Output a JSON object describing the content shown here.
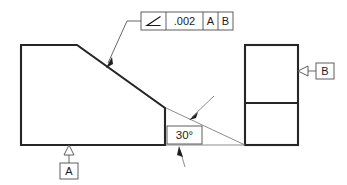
{
  "drawing": {
    "title": "Angularity Tolerance Drawing",
    "background_color": "#ffffff",
    "line_color": "#262626",
    "thin_line_color": "#6e6e6e"
  },
  "feature_control_frame": {
    "name": "angularity-feature-control-frame",
    "symbol": "angularity-symbol",
    "symbol_glyph": "∠",
    "tolerance_value": ".002",
    "primary_datum": "A",
    "secondary_datum": "B"
  },
  "dimensions": {
    "basic_angle": "30°",
    "basic_angle_name": "basic-angle-dimension"
  },
  "datum_features": [
    {
      "label": "A",
      "name": "datum-feature-a",
      "position": "bottom-left-view"
    },
    {
      "label": "B",
      "name": "datum-feature-b",
      "position": "right-view-left-edge"
    }
  ],
  "views": {
    "left_view_name": "left-part-view",
    "right_view_name": "right-part-view"
  }
}
